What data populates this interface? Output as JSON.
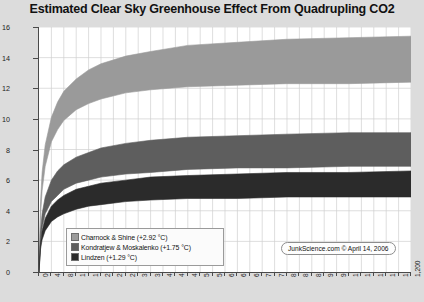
{
  "chart_data": {
    "type": "area",
    "title": "Estimated Clear Sky Greenhouse Effect From Quadrupling CO2",
    "xlabel": "",
    "ylabel": "Estimated Temperature (°C)",
    "xlim": [
      0,
      1200
    ],
    "ylim": [
      0,
      16
    ],
    "xticks": [
      0,
      40,
      80,
      120,
      160,
      200,
      240,
      280,
      320,
      360,
      400,
      440,
      480,
      520,
      560,
      600,
      640,
      680,
      720,
      760,
      800,
      840,
      880,
      920,
      960,
      1000,
      1040,
      1080,
      1120,
      1160,
      1200
    ],
    "xtick_labels": [
      "0",
      "40",
      "80",
      "120",
      "160",
      "200",
      "240",
      "280",
      "320",
      "360",
      "400",
      "440",
      "480",
      "520",
      "560",
      "600",
      "640",
      "680",
      "720",
      "760",
      "800",
      "840",
      "880",
      "920",
      "960",
      "1,000",
      "1,040",
      "1,080",
      "1,120",
      "1,160",
      "1,200"
    ],
    "yticks": [
      0,
      2,
      4,
      6,
      8,
      10,
      12,
      14,
      16
    ],
    "ytick_labels": [
      "0",
      "2",
      "4",
      "6",
      "8",
      "10",
      "12",
      "14",
      "16"
    ],
    "grid": true,
    "legend_position": "bottom-left",
    "series": [
      {
        "name": "Charnock & Shine",
        "delta_label": "(+2.92 °C)",
        "color": "#9a9a9a",
        "upper": [
          {
            "x": 0,
            "y": 0.0
          },
          {
            "x": 5,
            "y": 4.6
          },
          {
            "x": 10,
            "y": 6.5
          },
          {
            "x": 20,
            "y": 8.3
          },
          {
            "x": 40,
            "y": 10.1
          },
          {
            "x": 60,
            "y": 11.1
          },
          {
            "x": 80,
            "y": 11.8
          },
          {
            "x": 120,
            "y": 12.6
          },
          {
            "x": 160,
            "y": 13.2
          },
          {
            "x": 200,
            "y": 13.6
          },
          {
            "x": 280,
            "y": 14.1
          },
          {
            "x": 360,
            "y": 14.4
          },
          {
            "x": 480,
            "y": 14.8
          },
          {
            "x": 640,
            "y": 15.0
          },
          {
            "x": 800,
            "y": 15.2
          },
          {
            "x": 1000,
            "y": 15.3
          },
          {
            "x": 1200,
            "y": 15.4
          }
        ],
        "lower": [
          {
            "x": 0,
            "y": 0.0
          },
          {
            "x": 5,
            "y": 3.7
          },
          {
            "x": 10,
            "y": 5.3
          },
          {
            "x": 20,
            "y": 6.9
          },
          {
            "x": 40,
            "y": 8.5
          },
          {
            "x": 60,
            "y": 9.3
          },
          {
            "x": 80,
            "y": 9.9
          },
          {
            "x": 120,
            "y": 10.6
          },
          {
            "x": 160,
            "y": 11.0
          },
          {
            "x": 200,
            "y": 11.3
          },
          {
            "x": 280,
            "y": 11.7
          },
          {
            "x": 360,
            "y": 11.9
          },
          {
            "x": 480,
            "y": 12.1
          },
          {
            "x": 640,
            "y": 12.2
          },
          {
            "x": 800,
            "y": 12.3
          },
          {
            "x": 1000,
            "y": 12.3
          },
          {
            "x": 1200,
            "y": 12.4
          }
        ]
      },
      {
        "name": "Kondratjew & Moskalenko",
        "delta_label": "(+1.75 °C)",
        "color": "#5e5e5e",
        "upper": [
          {
            "x": 0,
            "y": 0.0
          },
          {
            "x": 5,
            "y": 2.7
          },
          {
            "x": 10,
            "y": 3.8
          },
          {
            "x": 20,
            "y": 4.9
          },
          {
            "x": 40,
            "y": 6.0
          },
          {
            "x": 60,
            "y": 6.6
          },
          {
            "x": 80,
            "y": 7.0
          },
          {
            "x": 120,
            "y": 7.5
          },
          {
            "x": 160,
            "y": 7.8
          },
          {
            "x": 200,
            "y": 8.1
          },
          {
            "x": 280,
            "y": 8.4
          },
          {
            "x": 360,
            "y": 8.6
          },
          {
            "x": 480,
            "y": 8.8
          },
          {
            "x": 640,
            "y": 8.9
          },
          {
            "x": 800,
            "y": 9.0
          },
          {
            "x": 1000,
            "y": 9.1
          },
          {
            "x": 1200,
            "y": 9.1
          }
        ],
        "lower": [
          {
            "x": 0,
            "y": 0.0
          },
          {
            "x": 5,
            "y": 2.1
          },
          {
            "x": 10,
            "y": 2.9
          },
          {
            "x": 20,
            "y": 3.8
          },
          {
            "x": 40,
            "y": 4.6
          },
          {
            "x": 60,
            "y": 5.0
          },
          {
            "x": 80,
            "y": 5.4
          },
          {
            "x": 120,
            "y": 5.8
          },
          {
            "x": 160,
            "y": 6.0
          },
          {
            "x": 200,
            "y": 6.2
          },
          {
            "x": 280,
            "y": 6.4
          },
          {
            "x": 360,
            "y": 6.5
          },
          {
            "x": 480,
            "y": 6.7
          },
          {
            "x": 640,
            "y": 6.8
          },
          {
            "x": 800,
            "y": 6.8
          },
          {
            "x": 1000,
            "y": 6.9
          },
          {
            "x": 1200,
            "y": 6.9
          }
        ]
      },
      {
        "name": "Lindzen",
        "delta_label": "(+1.29 °C)",
        "color": "#2b2b2b",
        "upper": [
          {
            "x": 0,
            "y": 0.0
          },
          {
            "x": 5,
            "y": 1.9
          },
          {
            "x": 10,
            "y": 2.7
          },
          {
            "x": 20,
            "y": 3.5
          },
          {
            "x": 40,
            "y": 4.3
          },
          {
            "x": 60,
            "y": 4.7
          },
          {
            "x": 80,
            "y": 5.0
          },
          {
            "x": 120,
            "y": 5.4
          },
          {
            "x": 160,
            "y": 5.6
          },
          {
            "x": 200,
            "y": 5.8
          },
          {
            "x": 280,
            "y": 6.0
          },
          {
            "x": 360,
            "y": 6.2
          },
          {
            "x": 480,
            "y": 6.3
          },
          {
            "x": 640,
            "y": 6.4
          },
          {
            "x": 800,
            "y": 6.5
          },
          {
            "x": 1000,
            "y": 6.5
          },
          {
            "x": 1200,
            "y": 6.6
          }
        ],
        "lower": [
          {
            "x": 0,
            "y": 0.0
          },
          {
            "x": 5,
            "y": 1.5
          },
          {
            "x": 10,
            "y": 2.1
          },
          {
            "x": 20,
            "y": 2.7
          },
          {
            "x": 40,
            "y": 3.3
          },
          {
            "x": 60,
            "y": 3.6
          },
          {
            "x": 80,
            "y": 3.8
          },
          {
            "x": 120,
            "y": 4.1
          },
          {
            "x": 160,
            "y": 4.3
          },
          {
            "x": 200,
            "y": 4.4
          },
          {
            "x": 280,
            "y": 4.6
          },
          {
            "x": 360,
            "y": 4.7
          },
          {
            "x": 480,
            "y": 4.8
          },
          {
            "x": 640,
            "y": 4.8
          },
          {
            "x": 800,
            "y": 4.9
          },
          {
            "x": 1000,
            "y": 4.9
          },
          {
            "x": 1200,
            "y": 4.9
          }
        ]
      }
    ]
  },
  "legend": {
    "items": [
      {
        "label": "Charnock & Shine (+2.92 °C)",
        "color": "#9a9a9a"
      },
      {
        "label": "Kondratjew & Moskalenko (+1.75 °C)",
        "color": "#5e5e5e"
      },
      {
        "label": "Lindzen (+1.29 °C)",
        "color": "#2b2b2b"
      }
    ]
  },
  "credit": {
    "text": "JunkScience.com © April 14, 2006"
  },
  "colors": {
    "background": "#dcdcdc",
    "plot_background": "#ffffff",
    "axis": "#4a4a4a",
    "grid": "#d0d0d0"
  }
}
